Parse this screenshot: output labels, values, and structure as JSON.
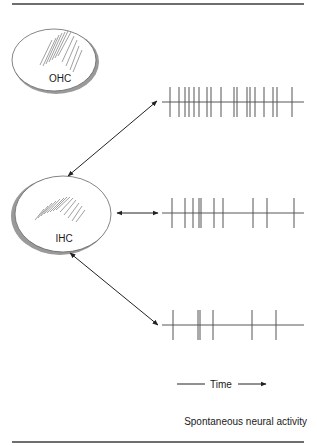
{
  "figure": {
    "cells": [
      {
        "id": "ohc",
        "label": "OHC"
      },
      {
        "id": "ihc",
        "label": "IHC"
      }
    ],
    "spike_trains": [
      {
        "name": "high-rate",
        "y": 102,
        "x_start": 162,
        "x_end": 304,
        "spikes": [
          170,
          179,
          185,
          189,
          194,
          199,
          207,
          211,
          221,
          234,
          237,
          247,
          250,
          255,
          264,
          273,
          277,
          292
        ]
      },
      {
        "name": "medium-rate",
        "y": 213,
        "x_start": 162,
        "x_end": 304,
        "spikes": [
          172,
          185,
          193,
          199,
          201,
          214,
          223,
          253,
          267,
          294
        ]
      },
      {
        "name": "low-rate",
        "y": 325,
        "x_start": 162,
        "x_end": 304,
        "spikes": [
          173,
          198,
          200,
          213,
          252,
          276
        ]
      }
    ],
    "time_axis_label": "Time",
    "caption": "Spontaneous neural activity"
  },
  "colors": {
    "rule": "#6e6e6e",
    "ink": "#222222",
    "spike": "#555555",
    "ellipse_shadow": "#9a9a9a"
  }
}
